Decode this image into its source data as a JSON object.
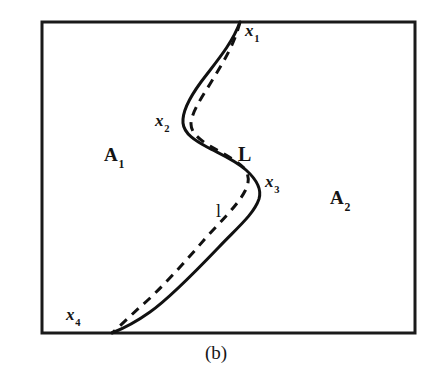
{
  "figure": {
    "caption": "(b)",
    "frame": {
      "x": 42,
      "y": 22,
      "width": 373,
      "height": 311,
      "stroke_color": "#1a1a1a",
      "stroke_width": 3
    },
    "regions": [
      {
        "name": "A1",
        "label": "A",
        "subscript": "1",
        "x": 104,
        "y": 145
      },
      {
        "name": "A2",
        "label": "A",
        "subscript": "2",
        "x": 330,
        "y": 188
      }
    ],
    "points": [
      {
        "name": "x1",
        "label": "x",
        "subscript": "1",
        "label_x": 245,
        "label_y": 22,
        "curve_x": 240,
        "curve_y": 22
      },
      {
        "name": "x2",
        "label": "x",
        "subscript": "2",
        "label_x": 155,
        "label_y": 112,
        "curve_x": 184,
        "curve_y": 129
      },
      {
        "name": "x3",
        "label": "x",
        "subscript": "3",
        "label_x": 265,
        "label_y": 173,
        "curve_x": 261,
        "curve_y": 184
      },
      {
        "name": "x4",
        "label": "x",
        "subscript": "4",
        "label_x": 66,
        "label_y": 306,
        "curve_x": 112,
        "curve_y": 333
      }
    ],
    "curves": [
      {
        "name": "solid-curve-L",
        "label": "L",
        "style": "solid",
        "stroke_color": "#111111",
        "stroke_width": 3,
        "label_x": 238,
        "label_y": 144,
        "path": "M 240 22 C 232 44 216 62 201 82 C 190 97 182 112 183 123 C 184 134 196 141 207 147 C 220 154 235 160 246 170 C 256 179 262 189 259 199 C 254 214 237 228 219 247 C 197 270 170 298 150 312 C 136 322 122 329 112 333"
      },
      {
        "name": "dashed-curve-l",
        "label": "l",
        "style": "dashed",
        "stroke_color": "#111111",
        "stroke_width": 3,
        "dash_pattern": "9 7",
        "label_x": 216,
        "label_y": 202,
        "path": "M 240 22 C 234 46 222 64 210 84 C 200 100 191 114 191 124 C 191 133 200 140 210 146 C 222 153 236 160 244 168 C 249 174 250 182 245 191 C 238 205 220 222 204 240 C 184 263 158 292 140 307 C 128 318 118 328 112 333"
      }
    ]
  }
}
